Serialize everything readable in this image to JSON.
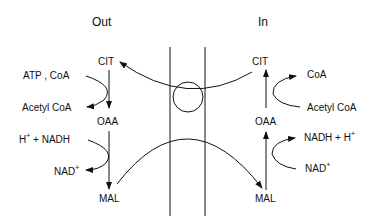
{
  "headers": {
    "out": "Out",
    "in": "In"
  },
  "out_side": {
    "cit": "CIT",
    "oaa": "OAA",
    "mal": "MAL",
    "reactant1": "ATP , CoA",
    "product1": "Acetyl CoA",
    "reactant2": "H",
    "reactant2_sup": "+",
    "reactant2_rest": " + NADH",
    "product2": "NAD",
    "product2_sup": "+"
  },
  "in_side": {
    "cit": "CIT",
    "oaa": "OAA",
    "mal": "MAL",
    "product1": "CoA",
    "reactant1": "Acetyl CoA",
    "product2": "NADH + H",
    "product2_sup": "+",
    "reactant2": "NAD",
    "reactant2_sup": "+"
  }
}
